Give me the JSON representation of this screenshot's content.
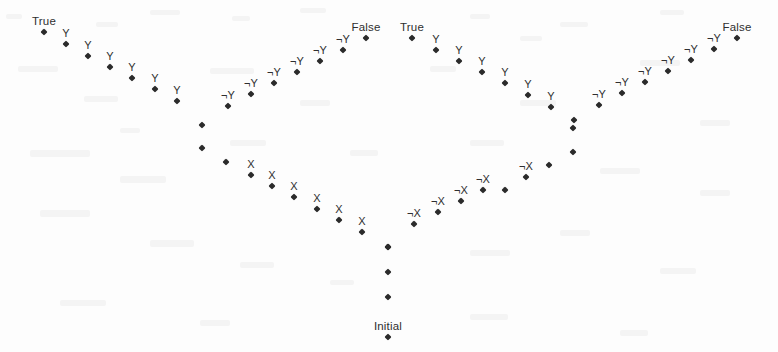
{
  "figure": {
    "type": "state-transition-trellis-diagram",
    "width": 778,
    "height": 352,
    "background_color": "#fdfdfd",
    "node_color": "#2b2b2b",
    "label_color": "#2f2f2f",
    "endpoint_labels": {
      "left_top": "True",
      "center_left": "False",
      "center_right": "True",
      "right_top": "False",
      "bottom": "Initial"
    }
  },
  "chart_data": {
    "type": "scatter",
    "title": "",
    "xlabel": "",
    "ylabel": "",
    "xlim": [
      0,
      778
    ],
    "ylim": [
      0,
      352
    ],
    "grid": false,
    "legend": "none",
    "marker": "diamond",
    "annotations": [
      "True",
      "False",
      "True",
      "False",
      "Initial"
    ],
    "branch_labels": [
      "Y",
      "¬Y",
      "X",
      "¬X"
    ],
    "series": [
      {
        "name": "left-outer-branch",
        "points": [
          {
            "x": 44,
            "y": 32,
            "label": "True",
            "label_pos": "above",
            "label_class": "big"
          },
          {
            "x": 66,
            "y": 44,
            "label": "Y",
            "label_pos": "above"
          },
          {
            "x": 88,
            "y": 56,
            "label": "Y",
            "label_pos": "above"
          },
          {
            "x": 110,
            "y": 67,
            "label": "Y",
            "label_pos": "above"
          },
          {
            "x": 132,
            "y": 78,
            "label": "Y",
            "label_pos": "above"
          },
          {
            "x": 155,
            "y": 89,
            "label": "Y",
            "label_pos": "above"
          },
          {
            "x": 177,
            "y": 101,
            "label": "Y",
            "label_pos": "above"
          },
          {
            "x": 202,
            "y": 125,
            "label": "",
            "label_pos": "above"
          },
          {
            "x": 202,
            "y": 148,
            "label": "",
            "label_pos": "above"
          },
          {
            "x": 226,
            "y": 162,
            "label": "",
            "label_pos": "above"
          },
          {
            "x": 251,
            "y": 175,
            "label": "X",
            "label_pos": "above"
          },
          {
            "x": 272,
            "y": 186,
            "label": "X",
            "label_pos": "above"
          },
          {
            "x": 294,
            "y": 197,
            "label": "X",
            "label_pos": "above"
          },
          {
            "x": 317,
            "y": 209,
            "label": "X",
            "label_pos": "above"
          },
          {
            "x": 339,
            "y": 220,
            "label": "X",
            "label_pos": "above"
          },
          {
            "x": 362,
            "y": 232,
            "label": "X",
            "label_pos": "above"
          },
          {
            "x": 388,
            "y": 247,
            "label": "",
            "label_pos": "above"
          }
        ]
      },
      {
        "name": "left-inner-branch",
        "points": [
          {
            "x": 366,
            "y": 38,
            "label": "False",
            "label_pos": "above",
            "label_class": "big"
          },
          {
            "x": 343,
            "y": 50,
            "label": "¬Y",
            "label_pos": "above"
          },
          {
            "x": 320,
            "y": 61,
            "label": "¬Y",
            "label_pos": "above"
          },
          {
            "x": 297,
            "y": 72,
            "label": "¬Y",
            "label_pos": "above"
          },
          {
            "x": 274,
            "y": 83,
            "label": "¬Y",
            "label_pos": "above"
          },
          {
            "x": 251,
            "y": 94,
            "label": "¬Y",
            "label_pos": "above"
          },
          {
            "x": 228,
            "y": 106,
            "label": "¬Y",
            "label_pos": "above"
          }
        ]
      },
      {
        "name": "right-inner-branch",
        "points": [
          {
            "x": 412,
            "y": 38,
            "label": "True",
            "label_pos": "above",
            "label_class": "big"
          },
          {
            "x": 436,
            "y": 50,
            "label": "Y",
            "label_pos": "above"
          },
          {
            "x": 459,
            "y": 61,
            "label": "Y",
            "label_pos": "above"
          },
          {
            "x": 482,
            "y": 72,
            "label": "Y",
            "label_pos": "above"
          },
          {
            "x": 505,
            "y": 83,
            "label": "Y",
            "label_pos": "above"
          },
          {
            "x": 528,
            "y": 95,
            "label": "Y",
            "label_pos": "above"
          },
          {
            "x": 551,
            "y": 107,
            "label": "Y",
            "label_pos": "above"
          },
          {
            "x": 573,
            "y": 128,
            "label": "",
            "label_pos": "above"
          },
          {
            "x": 573,
            "y": 152,
            "label": "",
            "label_pos": "above"
          },
          {
            "x": 549,
            "y": 165,
            "label": "",
            "label_pos": "above"
          },
          {
            "x": 526,
            "y": 177,
            "label": "¬X",
            "label_pos": "above"
          },
          {
            "x": 505,
            "y": 190,
            "label": "",
            "label_pos": "above"
          },
          {
            "x": 483,
            "y": 190,
            "label": "¬X",
            "label_pos": "above"
          },
          {
            "x": 461,
            "y": 201,
            "label": "¬X",
            "label_pos": "above"
          },
          {
            "x": 438,
            "y": 212,
            "label": "¬X",
            "label_pos": "above"
          },
          {
            "x": 414,
            "y": 224,
            "label": "¬X",
            "label_pos": "above"
          }
        ]
      },
      {
        "name": "right-outer-branch",
        "points": [
          {
            "x": 737,
            "y": 38,
            "label": "False",
            "label_pos": "above",
            "label_class": "big"
          },
          {
            "x": 714,
            "y": 49,
            "label": "¬Y",
            "label_pos": "above"
          },
          {
            "x": 691,
            "y": 60,
            "label": "¬Y",
            "label_pos": "above"
          },
          {
            "x": 668,
            "y": 71,
            "label": "¬Y",
            "label_pos": "above"
          },
          {
            "x": 645,
            "y": 82,
            "label": "¬Y",
            "label_pos": "above"
          },
          {
            "x": 622,
            "y": 93,
            "label": "¬Y",
            "label_pos": "above"
          },
          {
            "x": 599,
            "y": 105,
            "label": "¬Y",
            "label_pos": "above"
          },
          {
            "x": 574,
            "y": 120,
            "label": "",
            "label_pos": "above"
          }
        ]
      },
      {
        "name": "trunk",
        "points": [
          {
            "x": 388,
            "y": 247,
            "label": "",
            "label_pos": "above"
          },
          {
            "x": 388,
            "y": 272,
            "label": "",
            "label_pos": "above"
          },
          {
            "x": 388,
            "y": 297,
            "label": "",
            "label_pos": "above"
          },
          {
            "x": 388,
            "y": 337,
            "label": "Initial",
            "label_pos": "above",
            "label_class": "big"
          }
        ]
      }
    ]
  }
}
